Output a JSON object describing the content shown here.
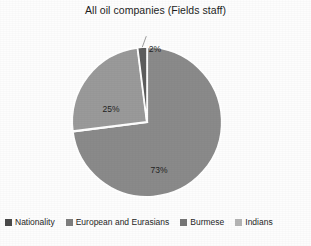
{
  "chart_data": {
    "type": "pie",
    "title": "All oil companies (Fields staff)",
    "categories": [
      "European and Eurasians",
      "Burmese",
      "Indians"
    ],
    "values": [
      2,
      25,
      73
    ],
    "value_labels": [
      "2%",
      "25%",
      "73%"
    ],
    "units": "percent",
    "legend_position": "bottom",
    "grid": false,
    "start_angle_deg": 0,
    "direction": "clockwise",
    "slices": [
      {
        "label": "2%",
        "value": 2,
        "category": "European and Eurasians",
        "color": "#5d5d5d",
        "label_placement": "outside-leader-line"
      },
      {
        "label": "25%",
        "value": 25,
        "category": "Burmese",
        "color": "#9a9a9a",
        "label_placement": "inside"
      },
      {
        "label": "73%",
        "value": 73,
        "category": "Indians",
        "color": "#8a8a8a",
        "label_placement": "inside"
      }
    ]
  },
  "chart": {
    "title": "All oil companies (Fields staff)",
    "labels": {
      "slice_2": "2%",
      "slice_25": "25%",
      "slice_73": "73%"
    }
  },
  "legend": {
    "items": [
      {
        "label": "Nationality",
        "color": "#4a4a4a"
      },
      {
        "label": "European and Eurasians",
        "color": "#7e7e7e"
      },
      {
        "label": "Burmese",
        "color": "#767676"
      },
      {
        "label": "Indians",
        "color": "#b4b4b4"
      }
    ]
  },
  "colors": {
    "slice_border": "#ffffff",
    "plot_background": "#fdfdfd",
    "text": "#1f1f1f"
  }
}
